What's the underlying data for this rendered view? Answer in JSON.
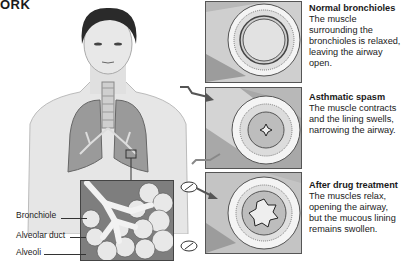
{
  "heading": {
    "text": "ORK"
  },
  "anatomy_labels": [
    {
      "text": "Bronchiole"
    },
    {
      "text": "Alveolar duct"
    },
    {
      "text": "Alveoli"
    }
  ],
  "panels": [
    {
      "title": "Normal bronchioles",
      "body": "The muscle surrounding the bronchioles is relaxed, leaving the airway open.",
      "state": "normal"
    },
    {
      "title": "Asthmatic spasm",
      "body": "The muscle contracts and the lining swells, narrowing the airway.",
      "state": "spasm"
    },
    {
      "title": "After drug treatment",
      "body": "The muscles relax, opening the airway, but the mucous lining remains swollen.",
      "state": "treated"
    }
  ],
  "icons": {
    "trigger": "wavy-arrow-icon",
    "drug": "pill-icon"
  },
  "colors": {
    "panel_bg": "#b8b8b8",
    "lung": "#8f8f8f",
    "inset_bg": "#7e7e7e",
    "skin": "#e4e4e4"
  }
}
